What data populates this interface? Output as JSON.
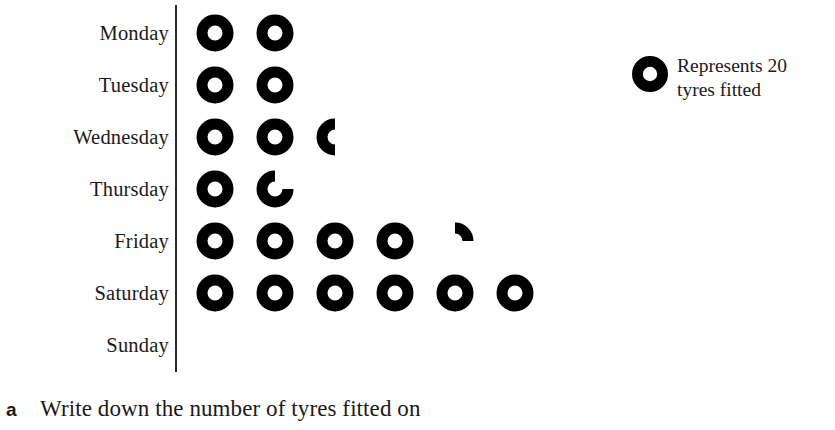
{
  "chart_data": {
    "type": "pictogram",
    "title": "",
    "xlabel": "",
    "ylabel": "",
    "key_value": 20,
    "key_unit": "tyres fitted",
    "symbol_icon": "ring-icon",
    "categories": [
      "Monday",
      "Tuesday",
      "Wednesday",
      "Thursday",
      "Friday",
      "Saturday",
      "Sunday"
    ],
    "values": [
      40,
      40,
      50,
      35,
      90,
      120,
      0
    ],
    "symbol_counts": [
      2,
      2,
      2.5,
      1.75,
      4.25,
      6,
      0
    ],
    "rows": [
      {
        "label": "Monday",
        "full": 2,
        "partial": 0,
        "value": 40,
        "partial_shape": "none"
      },
      {
        "label": "Tuesday",
        "full": 2,
        "partial": 0,
        "value": 40,
        "partial_shape": "none"
      },
      {
        "label": "Wednesday",
        "full": 2,
        "partial": 0.5,
        "value": 50,
        "partial_shape": "left-half"
      },
      {
        "label": "Thursday",
        "full": 1,
        "partial": 0.75,
        "value": 35,
        "partial_shape": "three-quarter"
      },
      {
        "label": "Friday",
        "full": 4,
        "partial": 0.25,
        "value": 90,
        "partial_shape": "top-right-quarter"
      },
      {
        "label": "Saturday",
        "full": 6,
        "partial": 0,
        "value": 120,
        "partial_shape": "none"
      },
      {
        "label": "Sunday",
        "full": 0,
        "partial": 0,
        "value": 0,
        "partial_shape": "none"
      }
    ],
    "grid": false,
    "legend_position": "right"
  },
  "legend": {
    "line1": "Represents 20",
    "line2": "tyres fitted"
  },
  "question": {
    "letter": "a",
    "text": "Write down the number of tyres fitted on"
  },
  "colors": {
    "symbol": "#000000",
    "axis": "#2b2b2b",
    "text": "#1a1a1a",
    "background": "#ffffff"
  }
}
